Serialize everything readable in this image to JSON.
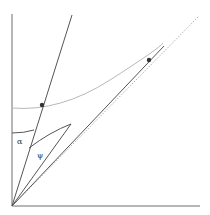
{
  "diagram": {
    "labels": {
      "alpha": "α",
      "psi": "ψ"
    },
    "colors": {
      "axis": "#6e6e6e",
      "line": "#555555",
      "curve": "#b0b0b0",
      "dotted": "#9a9a9a",
      "point": "#333333",
      "background": "#ffffff"
    }
  }
}
